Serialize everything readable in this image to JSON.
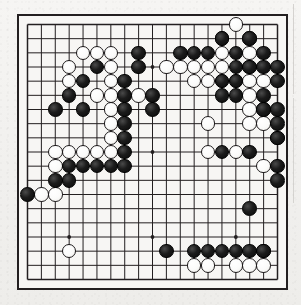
{
  "document": {
    "title": "Go game board position",
    "medium": "scanned black-and-white diagram"
  },
  "board": {
    "name": "go-board",
    "size": 19,
    "line_color": "#231f20",
    "border_color": "#231f20",
    "background_color": "#f7f6f4",
    "black_stone_color": "#111111",
    "white_stone_color": "#ffffff",
    "star_point_label": "hoshi",
    "star_points": [
      [
        4,
        4
      ],
      [
        10,
        4
      ],
      [
        16,
        4
      ],
      [
        4,
        10
      ],
      [
        10,
        10
      ],
      [
        16,
        10
      ],
      [
        4,
        16
      ],
      [
        10,
        16
      ],
      [
        16,
        16
      ]
    ],
    "stone_counts": {
      "black": 78,
      "white": 63,
      "total": 141
    },
    "black_stones": [
      [
        15,
        2
      ],
      [
        17,
        2
      ],
      [
        9,
        3
      ],
      [
        12,
        3
      ],
      [
        13,
        3
      ],
      [
        14,
        3
      ],
      [
        16,
        3
      ],
      [
        18,
        3
      ],
      [
        6,
        4
      ],
      [
        9,
        4
      ],
      [
        16,
        4
      ],
      [
        17,
        4
      ],
      [
        18,
        4
      ],
      [
        19,
        4
      ],
      [
        5,
        5
      ],
      [
        8,
        5
      ],
      [
        15,
        5
      ],
      [
        16,
        5
      ],
      [
        19,
        5
      ],
      [
        4,
        6
      ],
      [
        8,
        6
      ],
      [
        10,
        6
      ],
      [
        15,
        6
      ],
      [
        16,
        6
      ],
      [
        18,
        6
      ],
      [
        3,
        7
      ],
      [
        5,
        7
      ],
      [
        8,
        7
      ],
      [
        10,
        7
      ],
      [
        18,
        7
      ],
      [
        19,
        7
      ],
      [
        8,
        8
      ],
      [
        19,
        8
      ],
      [
        8,
        9
      ],
      [
        19,
        9
      ],
      [
        8,
        10
      ],
      [
        15,
        10
      ],
      [
        17,
        10
      ],
      [
        4,
        11
      ],
      [
        5,
        11
      ],
      [
        6,
        11
      ],
      [
        7,
        11
      ],
      [
        8,
        11
      ],
      [
        19,
        11
      ],
      [
        3,
        12
      ],
      [
        4,
        12
      ],
      [
        19,
        12
      ],
      [
        1,
        13
      ],
      [
        17,
        14
      ],
      [
        11,
        17
      ],
      [
        13,
        17
      ],
      [
        14,
        17
      ],
      [
        15,
        17
      ],
      [
        16,
        17
      ],
      [
        17,
        17
      ],
      [
        18,
        17
      ]
    ],
    "white_stones": [
      [
        16,
        1
      ],
      [
        15,
        2
      ],
      [
        17,
        2
      ],
      [
        5,
        3
      ],
      [
        6,
        3
      ],
      [
        7,
        3
      ],
      [
        15,
        3
      ],
      [
        17,
        3
      ],
      [
        4,
        4
      ],
      [
        7,
        4
      ],
      [
        11,
        4
      ],
      [
        12,
        4
      ],
      [
        13,
        4
      ],
      [
        14,
        4
      ],
      [
        15,
        4
      ],
      [
        17,
        4
      ],
      [
        4,
        5
      ],
      [
        7,
        5
      ],
      [
        13,
        5
      ],
      [
        14,
        5
      ],
      [
        15,
        5
      ],
      [
        16,
        5
      ],
      [
        17,
        5
      ],
      [
        18,
        5
      ],
      [
        6,
        6
      ],
      [
        7,
        6
      ],
      [
        9,
        6
      ],
      [
        17,
        6
      ],
      [
        7,
        7
      ],
      [
        17,
        7
      ],
      [
        18,
        7
      ],
      [
        7,
        8
      ],
      [
        14,
        8
      ],
      [
        17,
        8
      ],
      [
        18,
        8
      ],
      [
        7,
        9
      ],
      [
        19,
        9
      ],
      [
        3,
        10
      ],
      [
        4,
        10
      ],
      [
        5,
        10
      ],
      [
        6,
        10
      ],
      [
        7,
        10
      ],
      [
        14,
        10
      ],
      [
        16,
        10
      ],
      [
        3,
        11
      ],
      [
        18,
        11
      ],
      [
        2,
        13
      ],
      [
        3,
        13
      ],
      [
        4,
        17
      ],
      [
        18,
        17
      ],
      [
        13,
        18
      ],
      [
        14,
        18
      ],
      [
        16,
        18
      ],
      [
        17,
        18
      ],
      [
        18,
        18
      ]
    ]
  },
  "notes": {
    "left_edge_marks": "faint vertical scan rules at image right margin"
  }
}
